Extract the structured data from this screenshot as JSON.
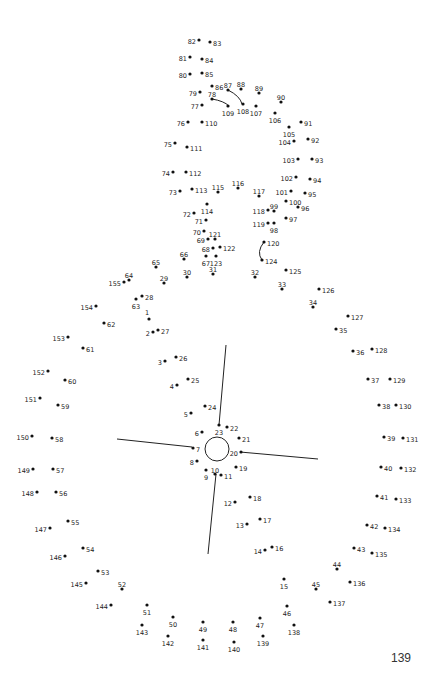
{
  "page": {
    "page_number": "139",
    "colors": {
      "dot": "#111111",
      "line": "#222222",
      "label": "#222222",
      "background": "#ffffff"
    }
  },
  "guide_lines": [
    {
      "name": "guide-line-north",
      "x1": 226,
      "y1": 345,
      "x2": 219,
      "y2": 425
    },
    {
      "name": "guide-line-west",
      "x1": 117,
      "y1": 439,
      "x2": 192,
      "y2": 447
    },
    {
      "name": "guide-line-east",
      "x1": 240,
      "y1": 452,
      "x2": 318,
      "y2": 459
    },
    {
      "name": "guide-line-south",
      "x1": 216,
      "y1": 474,
      "x2": 208,
      "y2": 554
    }
  ],
  "guide_circle": {
    "cx": 217,
    "cy": 449,
    "r": 12
  },
  "guide_curves": [
    {
      "name": "curve-78-109",
      "d": "M212,99 Q224,101 229,106"
    },
    {
      "name": "curve-87-108",
      "d": "M228,90 Q240,96 242,104"
    },
    {
      "name": "curve-120-124",
      "d": "M264,242 Q256,252 262,260"
    }
  ],
  "dots": [
    {
      "n": "1",
      "x": 149,
      "y": 319,
      "lx": 147,
      "ly": 313,
      "a": "middle"
    },
    {
      "n": "2",
      "x": 153,
      "y": 332,
      "lx": 150,
      "ly": 334,
      "a": "end"
    },
    {
      "n": "3",
      "x": 165,
      "y": 361,
      "lx": 162,
      "ly": 363,
      "a": "end"
    },
    {
      "n": "4",
      "x": 177,
      "y": 385,
      "lx": 174,
      "ly": 387,
      "a": "end"
    },
    {
      "n": "5",
      "x": 191,
      "y": 413,
      "lx": 188,
      "ly": 415,
      "a": "end"
    },
    {
      "n": "6",
      "x": 202,
      "y": 432,
      "lx": 199,
      "ly": 434,
      "a": "end"
    },
    {
      "n": "7",
      "x": 193,
      "y": 448,
      "lx": 196,
      "ly": 450,
      "a": "start"
    },
    {
      "n": "8",
      "x": 197,
      "y": 461,
      "lx": 194,
      "ly": 463,
      "a": "end"
    },
    {
      "n": "9",
      "x": 206,
      "y": 470,
      "lx": 206,
      "ly": 478,
      "a": "middle"
    },
    {
      "n": "10",
      "x": 215,
      "y": 474,
      "lx": 215,
      "ly": 471,
      "a": "middle"
    },
    {
      "n": "11",
      "x": 221,
      "y": 475,
      "lx": 224,
      "ly": 477,
      "a": "start"
    },
    {
      "n": "12",
      "x": 235,
      "y": 502,
      "lx": 232,
      "ly": 504,
      "a": "end"
    },
    {
      "n": "13",
      "x": 247,
      "y": 524,
      "lx": 244,
      "ly": 526,
      "a": "end"
    },
    {
      "n": "14",
      "x": 265,
      "y": 550,
      "lx": 262,
      "ly": 552,
      "a": "end"
    },
    {
      "n": "15",
      "x": 284,
      "y": 579,
      "lx": 284,
      "ly": 587,
      "a": "middle"
    },
    {
      "n": "16",
      "x": 272,
      "y": 547,
      "lx": 275,
      "ly": 549,
      "a": "start"
    },
    {
      "n": "17",
      "x": 260,
      "y": 519,
      "lx": 263,
      "ly": 521,
      "a": "start"
    },
    {
      "n": "18",
      "x": 250,
      "y": 497,
      "lx": 253,
      "ly": 499,
      "a": "start"
    },
    {
      "n": "19",
      "x": 236,
      "y": 467,
      "lx": 239,
      "ly": 469,
      "a": "start"
    },
    {
      "n": "20",
      "x": 241,
      "y": 452,
      "lx": 238,
      "ly": 454,
      "a": "end"
    },
    {
      "n": "21",
      "x": 239,
      "y": 438,
      "lx": 242,
      "ly": 440,
      "a": "start"
    },
    {
      "n": "22",
      "x": 227,
      "y": 427,
      "lx": 230,
      "ly": 429,
      "a": "start"
    },
    {
      "n": "23",
      "x": 219,
      "y": 425,
      "lx": 219,
      "ly": 433,
      "a": "middle"
    },
    {
      "n": "24",
      "x": 205,
      "y": 406,
      "lx": 208,
      "ly": 408,
      "a": "start"
    },
    {
      "n": "25",
      "x": 188,
      "y": 379,
      "lx": 191,
      "ly": 381,
      "a": "start"
    },
    {
      "n": "26",
      "x": 176,
      "y": 357,
      "lx": 179,
      "ly": 359,
      "a": "start"
    },
    {
      "n": "27",
      "x": 158,
      "y": 330,
      "lx": 161,
      "ly": 332,
      "a": "start"
    },
    {
      "n": "28",
      "x": 142,
      "y": 296,
      "lx": 145,
      "ly": 298,
      "a": "start"
    },
    {
      "n": "29",
      "x": 164,
      "y": 283,
      "lx": 164,
      "ly": 279,
      "a": "middle"
    },
    {
      "n": "30",
      "x": 187,
      "y": 277,
      "lx": 187,
      "ly": 273,
      "a": "middle"
    },
    {
      "n": "31",
      "x": 213,
      "y": 274,
      "lx": 213,
      "ly": 270,
      "a": "middle"
    },
    {
      "n": "32",
      "x": 255,
      "y": 277,
      "lx": 255,
      "ly": 273,
      "a": "middle"
    },
    {
      "n": "33",
      "x": 282,
      "y": 289,
      "lx": 282,
      "ly": 285,
      "a": "middle"
    },
    {
      "n": "34",
      "x": 313,
      "y": 307,
      "lx": 313,
      "ly": 303,
      "a": "middle"
    },
    {
      "n": "35",
      "x": 336,
      "y": 329,
      "lx": 339,
      "ly": 331,
      "a": "start"
    },
    {
      "n": "36",
      "x": 353,
      "y": 351,
      "lx": 356,
      "ly": 353,
      "a": "start"
    },
    {
      "n": "37",
      "x": 368,
      "y": 379,
      "lx": 371,
      "ly": 381,
      "a": "start"
    },
    {
      "n": "38",
      "x": 379,
      "y": 405,
      "lx": 382,
      "ly": 407,
      "a": "start"
    },
    {
      "n": "39",
      "x": 384,
      "y": 437,
      "lx": 387,
      "ly": 439,
      "a": "start"
    },
    {
      "n": "40",
      "x": 381,
      "y": 467,
      "lx": 384,
      "ly": 469,
      "a": "start"
    },
    {
      "n": "41",
      "x": 377,
      "y": 496,
      "lx": 380,
      "ly": 498,
      "a": "start"
    },
    {
      "n": "42",
      "x": 367,
      "y": 525,
      "lx": 370,
      "ly": 527,
      "a": "start"
    },
    {
      "n": "43",
      "x": 354,
      "y": 548,
      "lx": 357,
      "ly": 550,
      "a": "start"
    },
    {
      "n": "44",
      "x": 337,
      "y": 569,
      "lx": 337,
      "ly": 565,
      "a": "middle"
    },
    {
      "n": "45",
      "x": 316,
      "y": 589,
      "lx": 316,
      "ly": 585,
      "a": "middle"
    },
    {
      "n": "46",
      "x": 287,
      "y": 606,
      "lx": 287,
      "ly": 614,
      "a": "middle"
    },
    {
      "n": "47",
      "x": 260,
      "y": 618,
      "lx": 260,
      "ly": 626,
      "a": "middle"
    },
    {
      "n": "48",
      "x": 233,
      "y": 622,
      "lx": 233,
      "ly": 630,
      "a": "middle"
    },
    {
      "n": "49",
      "x": 203,
      "y": 622,
      "lx": 203,
      "ly": 630,
      "a": "middle"
    },
    {
      "n": "50",
      "x": 173,
      "y": 617,
      "lx": 173,
      "ly": 625,
      "a": "middle"
    },
    {
      "n": "51",
      "x": 147,
      "y": 605,
      "lx": 147,
      "ly": 613,
      "a": "middle"
    },
    {
      "n": "52",
      "x": 122,
      "y": 589,
      "lx": 122,
      "ly": 585,
      "a": "middle"
    },
    {
      "n": "53",
      "x": 98,
      "y": 571,
      "lx": 101,
      "ly": 573,
      "a": "start"
    },
    {
      "n": "54",
      "x": 83,
      "y": 548,
      "lx": 86,
      "ly": 550,
      "a": "start"
    },
    {
      "n": "55",
      "x": 68,
      "y": 521,
      "lx": 71,
      "ly": 523,
      "a": "start"
    },
    {
      "n": "56",
      "x": 56,
      "y": 492,
      "lx": 59,
      "ly": 494,
      "a": "start"
    },
    {
      "n": "57",
      "x": 53,
      "y": 469,
      "lx": 56,
      "ly": 471,
      "a": "start"
    },
    {
      "n": "58",
      "x": 52,
      "y": 438,
      "lx": 55,
      "ly": 440,
      "a": "start"
    },
    {
      "n": "59",
      "x": 58,
      "y": 405,
      "lx": 61,
      "ly": 407,
      "a": "start"
    },
    {
      "n": "60",
      "x": 65,
      "y": 380,
      "lx": 68,
      "ly": 382,
      "a": "start"
    },
    {
      "n": "61",
      "x": 83,
      "y": 348,
      "lx": 86,
      "ly": 350,
      "a": "start"
    },
    {
      "n": "62",
      "x": 104,
      "y": 323,
      "lx": 107,
      "ly": 325,
      "a": "start"
    },
    {
      "n": "63",
      "x": 136,
      "y": 299,
      "lx": 136,
      "ly": 307,
      "a": "middle"
    },
    {
      "n": "64",
      "x": 129,
      "y": 280,
      "lx": 129,
      "ly": 276,
      "a": "middle"
    },
    {
      "n": "65",
      "x": 156,
      "y": 267,
      "lx": 156,
      "ly": 263,
      "a": "middle"
    },
    {
      "n": "66",
      "x": 184,
      "y": 259,
      "lx": 184,
      "ly": 255,
      "a": "middle"
    },
    {
      "n": "67",
      "x": 206,
      "y": 256,
      "lx": 206,
      "ly": 264,
      "a": "middle"
    },
    {
      "n": "68",
      "x": 213,
      "y": 248,
      "lx": 210,
      "ly": 250,
      "a": "end"
    },
    {
      "n": "69",
      "x": 208,
      "y": 239,
      "lx": 205,
      "ly": 241,
      "a": "end"
    },
    {
      "n": "70",
      "x": 204,
      "y": 231,
      "lx": 201,
      "ly": 233,
      "a": "end"
    },
    {
      "n": "71",
      "x": 206,
      "y": 220,
      "lx": 203,
      "ly": 222,
      "a": "end"
    },
    {
      "n": "72",
      "x": 194,
      "y": 213,
      "lx": 191,
      "ly": 215,
      "a": "end"
    },
    {
      "n": "73",
      "x": 180,
      "y": 191,
      "lx": 177,
      "ly": 193,
      "a": "end"
    },
    {
      "n": "74",
      "x": 173,
      "y": 172,
      "lx": 170,
      "ly": 174,
      "a": "end"
    },
    {
      "n": "75",
      "x": 175,
      "y": 143,
      "lx": 172,
      "ly": 145,
      "a": "end"
    },
    {
      "n": "76",
      "x": 188,
      "y": 122,
      "lx": 185,
      "ly": 124,
      "a": "end"
    },
    {
      "n": "77",
      "x": 202,
      "y": 105,
      "lx": 199,
      "ly": 107,
      "a": "end"
    },
    {
      "n": "78",
      "x": 212,
      "y": 99,
      "lx": 212,
      "ly": 95,
      "a": "middle"
    },
    {
      "n": "79",
      "x": 200,
      "y": 92,
      "lx": 197,
      "ly": 94,
      "a": "end"
    },
    {
      "n": "80",
      "x": 190,
      "y": 74,
      "lx": 187,
      "ly": 76,
      "a": "end"
    },
    {
      "n": "81",
      "x": 190,
      "y": 57,
      "lx": 187,
      "ly": 59,
      "a": "end"
    },
    {
      "n": "82",
      "x": 199,
      "y": 40,
      "lx": 196,
      "ly": 42,
      "a": "end"
    },
    {
      "n": "83",
      "x": 210,
      "y": 42,
      "lx": 213,
      "ly": 44,
      "a": "start"
    },
    {
      "n": "84",
      "x": 202,
      "y": 59,
      "lx": 205,
      "ly": 61,
      "a": "start"
    },
    {
      "n": "85",
      "x": 202,
      "y": 73,
      "lx": 205,
      "ly": 75,
      "a": "start"
    },
    {
      "n": "86",
      "x": 212,
      "y": 86,
      "lx": 215,
      "ly": 88,
      "a": "start"
    },
    {
      "n": "87",
      "x": 228,
      "y": 90,
      "lx": 228,
      "ly": 86,
      "a": "middle"
    },
    {
      "n": "88",
      "x": 241,
      "y": 89,
      "lx": 241,
      "ly": 85,
      "a": "middle"
    },
    {
      "n": "89",
      "x": 259,
      "y": 93,
      "lx": 259,
      "ly": 89,
      "a": "middle"
    },
    {
      "n": "90",
      "x": 281,
      "y": 102,
      "lx": 281,
      "ly": 98,
      "a": "middle"
    },
    {
      "n": "91",
      "x": 301,
      "y": 122,
      "lx": 304,
      "ly": 124,
      "a": "start"
    },
    {
      "n": "92",
      "x": 308,
      "y": 139,
      "lx": 311,
      "ly": 141,
      "a": "start"
    },
    {
      "n": "93",
      "x": 312,
      "y": 159,
      "lx": 315,
      "ly": 161,
      "a": "start"
    },
    {
      "n": "94",
      "x": 310,
      "y": 179,
      "lx": 313,
      "ly": 181,
      "a": "start"
    },
    {
      "n": "95",
      "x": 305,
      "y": 193,
      "lx": 308,
      "ly": 195,
      "a": "start"
    },
    {
      "n": "96",
      "x": 298,
      "y": 207,
      "lx": 301,
      "ly": 209,
      "a": "start"
    },
    {
      "n": "97",
      "x": 286,
      "y": 218,
      "lx": 289,
      "ly": 220,
      "a": "start"
    },
    {
      "n": "98",
      "x": 274,
      "y": 223,
      "lx": 274,
      "ly": 231,
      "a": "middle"
    },
    {
      "n": "99",
      "x": 274,
      "y": 211,
      "lx": 274,
      "ly": 207,
      "a": "middle"
    },
    {
      "n": "100",
      "x": 286,
      "y": 201,
      "lx": 289,
      "ly": 203,
      "a": "start"
    },
    {
      "n": "101",
      "x": 291,
      "y": 191,
      "lx": 288,
      "ly": 193,
      "a": "end"
    },
    {
      "n": "102",
      "x": 296,
      "y": 177,
      "lx": 293,
      "ly": 179,
      "a": "end"
    },
    {
      "n": "103",
      "x": 298,
      "y": 159,
      "lx": 295,
      "ly": 161,
      "a": "end"
    },
    {
      "n": "104",
      "x": 294,
      "y": 141,
      "lx": 291,
      "ly": 143,
      "a": "end"
    },
    {
      "n": "105",
      "x": 289,
      "y": 127,
      "lx": 289,
      "ly": 135,
      "a": "middle"
    },
    {
      "n": "106",
      "x": 275,
      "y": 113,
      "lx": 275,
      "ly": 121,
      "a": "middle"
    },
    {
      "n": "107",
      "x": 256,
      "y": 106,
      "lx": 256,
      "ly": 114,
      "a": "middle"
    },
    {
      "n": "108",
      "x": 243,
      "y": 104,
      "lx": 243,
      "ly": 112,
      "a": "middle"
    },
    {
      "n": "109",
      "x": 228,
      "y": 106,
      "lx": 228,
      "ly": 114,
      "a": "middle"
    },
    {
      "n": "110",
      "x": 202,
      "y": 122,
      "lx": 205,
      "ly": 124,
      "a": "start"
    },
    {
      "n": "111",
      "x": 187,
      "y": 147,
      "lx": 190,
      "ly": 149,
      "a": "start"
    },
    {
      "n": "112",
      "x": 186,
      "y": 172,
      "lx": 189,
      "ly": 174,
      "a": "start"
    },
    {
      "n": "113",
      "x": 192,
      "y": 189,
      "lx": 195,
      "ly": 191,
      "a": "start"
    },
    {
      "n": "114",
      "x": 207,
      "y": 204,
      "lx": 207,
      "ly": 212,
      "a": "middle"
    },
    {
      "n": "115",
      "x": 218,
      "y": 192,
      "lx": 218,
      "ly": 188,
      "a": "middle"
    },
    {
      "n": "116",
      "x": 238,
      "y": 188,
      "lx": 238,
      "ly": 184,
      "a": "middle"
    },
    {
      "n": "117",
      "x": 259,
      "y": 196,
      "lx": 259,
      "ly": 192,
      "a": "middle"
    },
    {
      "n": "118",
      "x": 268,
      "y": 210,
      "lx": 265,
      "ly": 212,
      "a": "end"
    },
    {
      "n": "119",
      "x": 268,
      "y": 223,
      "lx": 265,
      "ly": 225,
      "a": "end"
    },
    {
      "n": "120",
      "x": 264,
      "y": 242,
      "lx": 267,
      "ly": 244,
      "a": "start"
    },
    {
      "n": "121",
      "x": 215,
      "y": 239,
      "lx": 215,
      "ly": 235,
      "a": "middle"
    },
    {
      "n": "122",
      "x": 220,
      "y": 247,
      "lx": 223,
      "ly": 249,
      "a": "start"
    },
    {
      "n": "123",
      "x": 216,
      "y": 256,
      "lx": 216,
      "ly": 264,
      "a": "middle"
    },
    {
      "n": "124",
      "x": 262,
      "y": 260,
      "lx": 265,
      "ly": 262,
      "a": "start"
    },
    {
      "n": "125",
      "x": 286,
      "y": 270,
      "lx": 289,
      "ly": 272,
      "a": "start"
    },
    {
      "n": "126",
      "x": 319,
      "y": 289,
      "lx": 322,
      "ly": 291,
      "a": "start"
    },
    {
      "n": "127",
      "x": 348,
      "y": 316,
      "lx": 351,
      "ly": 318,
      "a": "start"
    },
    {
      "n": "128",
      "x": 372,
      "y": 349,
      "lx": 375,
      "ly": 351,
      "a": "start"
    },
    {
      "n": "129",
      "x": 390,
      "y": 379,
      "lx": 393,
      "ly": 381,
      "a": "start"
    },
    {
      "n": "130",
      "x": 396,
      "y": 405,
      "lx": 399,
      "ly": 407,
      "a": "start"
    },
    {
      "n": "131",
      "x": 403,
      "y": 438,
      "lx": 406,
      "ly": 440,
      "a": "start"
    },
    {
      "n": "132",
      "x": 401,
      "y": 468,
      "lx": 404,
      "ly": 470,
      "a": "start"
    },
    {
      "n": "133",
      "x": 396,
      "y": 499,
      "lx": 399,
      "ly": 501,
      "a": "start"
    },
    {
      "n": "134",
      "x": 385,
      "y": 528,
      "lx": 388,
      "ly": 530,
      "a": "start"
    },
    {
      "n": "135",
      "x": 372,
      "y": 553,
      "lx": 375,
      "ly": 555,
      "a": "start"
    },
    {
      "n": "136",
      "x": 350,
      "y": 582,
      "lx": 353,
      "ly": 584,
      "a": "start"
    },
    {
      "n": "137",
      "x": 330,
      "y": 602,
      "lx": 333,
      "ly": 604,
      "a": "start"
    },
    {
      "n": "138",
      "x": 294,
      "y": 625,
      "lx": 294,
      "ly": 633,
      "a": "middle"
    },
    {
      "n": "139",
      "x": 263,
      "y": 636,
      "lx": 263,
      "ly": 644,
      "a": "middle"
    },
    {
      "n": "140",
      "x": 234,
      "y": 642,
      "lx": 234,
      "ly": 650,
      "a": "middle"
    },
    {
      "n": "141",
      "x": 203,
      "y": 640,
      "lx": 203,
      "ly": 648,
      "a": "middle"
    },
    {
      "n": "142",
      "x": 168,
      "y": 636,
      "lx": 168,
      "ly": 644,
      "a": "middle"
    },
    {
      "n": "143",
      "x": 142,
      "y": 625,
      "lx": 142,
      "ly": 633,
      "a": "middle"
    },
    {
      "n": "144",
      "x": 111,
      "y": 605,
      "lx": 108,
      "ly": 607,
      "a": "end"
    },
    {
      "n": "145",
      "x": 86,
      "y": 583,
      "lx": 83,
      "ly": 585,
      "a": "end"
    },
    {
      "n": "146",
      "x": 65,
      "y": 556,
      "lx": 62,
      "ly": 558,
      "a": "end"
    },
    {
      "n": "147",
      "x": 50,
      "y": 528,
      "lx": 47,
      "ly": 530,
      "a": "end"
    },
    {
      "n": "148",
      "x": 37,
      "y": 492,
      "lx": 34,
      "ly": 494,
      "a": "end"
    },
    {
      "n": "149",
      "x": 33,
      "y": 469,
      "lx": 30,
      "ly": 471,
      "a": "end"
    },
    {
      "n": "150",
      "x": 32,
      "y": 436,
      "lx": 29,
      "ly": 438,
      "a": "end"
    },
    {
      "n": "151",
      "x": 40,
      "y": 398,
      "lx": 37,
      "ly": 400,
      "a": "end"
    },
    {
      "n": "152",
      "x": 48,
      "y": 371,
      "lx": 45,
      "ly": 373,
      "a": "end"
    },
    {
      "n": "153",
      "x": 68,
      "y": 337,
      "lx": 65,
      "ly": 339,
      "a": "end"
    },
    {
      "n": "154",
      "x": 96,
      "y": 306,
      "lx": 93,
      "ly": 308,
      "a": "end"
    },
    {
      "n": "155",
      "x": 124,
      "y": 282,
      "lx": 121,
      "ly": 284,
      "a": "end"
    }
  ]
}
